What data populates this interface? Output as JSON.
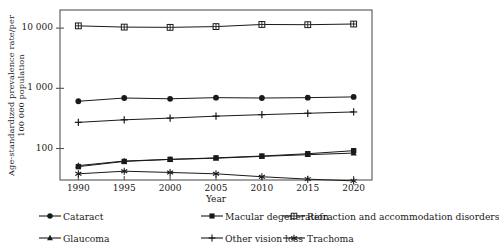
{
  "chart_data": {
    "type": "line",
    "title": "",
    "xlabel": "Year",
    "ylabel": "Age-standardized prevalence rate/per\n100 000 population",
    "x": [
      1990,
      1995,
      2000,
      2005,
      2010,
      2015,
      2020
    ],
    "xtick_labels": [
      "1990",
      "1995",
      "2000",
      "2005",
      "2010",
      "2015",
      "2020"
    ],
    "ytick_labels": [
      "100",
      "1 000",
      "10 000"
    ],
    "ytick_values": [
      100,
      1000,
      10000
    ],
    "yscale": "log",
    "ylim": [
      30,
      20000
    ],
    "xlim": [
      1988,
      2022
    ],
    "grid": false,
    "legend_position": "bottom",
    "series": [
      {
        "name": "Cataract",
        "marker": "filled-circle",
        "values": [
          610,
          690,
          670,
          700,
          690,
          700,
          720
        ]
      },
      {
        "name": "Macular degeneration",
        "marker": "filled-square",
        "values": [
          50,
          61,
          66,
          70,
          75,
          82,
          92
        ]
      },
      {
        "name": "Refraction and accommodation disorders",
        "marker": "open-square-cross",
        "values": [
          10900,
          10400,
          10300,
          10600,
          11500,
          11400,
          11700
        ]
      },
      {
        "name": "Glaucoma",
        "marker": "filled-triangle",
        "values": [
          52,
          62,
          66,
          69,
          74,
          79,
          84
        ]
      },
      {
        "name": "Other vision loss",
        "marker": "plus",
        "values": [
          272,
          300,
          320,
          345,
          365,
          385,
          405
        ]
      },
      {
        "name": "Trachoma",
        "marker": "asterisk",
        "values": [
          38,
          42,
          40,
          38,
          34,
          31,
          29
        ]
      }
    ]
  },
  "axis": {
    "x_title": "Year",
    "y_title": "Age-standardized prevalence rate/per\n100 000 population"
  },
  "legend": {
    "items": [
      {
        "label": "Cataract",
        "marker": "filled-circle"
      },
      {
        "label": "Macular degeneration",
        "marker": "filled-square"
      },
      {
        "label": "Refraction and accommodation disorders",
        "marker": "open-square-cross"
      },
      {
        "label": "Glaucoma",
        "marker": "filled-triangle"
      },
      {
        "label": "Other vision loss",
        "marker": "plus"
      },
      {
        "label": "Trachoma",
        "marker": "asterisk"
      }
    ]
  },
  "colors": {
    "line": "#1a1a1a",
    "axis": "#555555",
    "background": "#ffffff"
  }
}
